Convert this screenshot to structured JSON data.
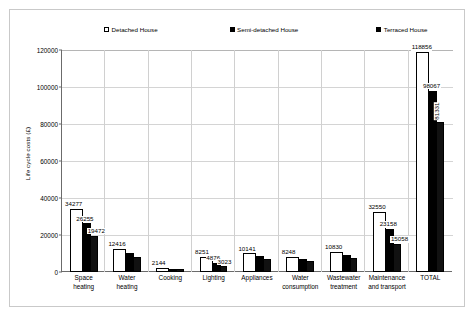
{
  "chart_data": {
    "type": "bar",
    "title": "",
    "subtitle": "",
    "xlabel": "",
    "ylabel": "Life cycle costs (£)",
    "ylim": [
      0,
      120000
    ],
    "yticks": [
      0,
      20000,
      40000,
      60000,
      80000,
      100000,
      120000
    ],
    "ytick_labels": [
      "0",
      "20000",
      "40000",
      "60000",
      "80000",
      "100000",
      "120000"
    ],
    "grid": true,
    "legend_position": "top",
    "categories": [
      "Space heating",
      "Water heating",
      "Cooking",
      "Lighting",
      "Appliances",
      "Water consumption",
      "Wastewater treatment",
      "Maintenance and transport",
      "TOTAL"
    ],
    "category_lines": [
      [
        "Space",
        "heating"
      ],
      [
        "Water",
        "heating"
      ],
      [
        "Cooking",
        ""
      ],
      [
        "Lighting",
        ""
      ],
      [
        "Appliances",
        ""
      ],
      [
        "Water",
        "consumption"
      ],
      [
        "Wastewater",
        "treatment"
      ],
      [
        "Maintenance",
        "and transport"
      ],
      [
        "TOTAL",
        ""
      ]
    ],
    "series": [
      {
        "name": "Detached House",
        "swatch": "white",
        "values": [
          34277,
          12416,
          2144,
          8251,
          10141,
          8248,
          10830,
          32550,
          118856
        ]
      },
      {
        "name": "Semi-detached House",
        "swatch": "black",
        "values": [
          26255,
          10200,
          1760,
          4876,
          8400,
          6900,
          9000,
          23158,
          98067
        ]
      },
      {
        "name": "Terraced House",
        "swatch": "hatch",
        "values": [
          19472,
          8300,
          1450,
          3023,
          7100,
          5800,
          7600,
          15058,
          81331
        ]
      }
    ],
    "visible_data_labels": {
      "Space heating": [
        "34277",
        "26255",
        "19472"
      ],
      "Water heating": [
        "12416"
      ],
      "Cooking": [
        "2144"
      ],
      "Lighting": [
        "8251",
        "4876",
        "3023"
      ],
      "Appliances": [
        "10141"
      ],
      "Water consumption": [
        "8248"
      ],
      "Wastewater treatment": [
        "10830"
      ],
      "Maintenance and transport": [
        "32550",
        "23158",
        "15058"
      ],
      "TOTAL": [
        "118856",
        "98067",
        "81331"
      ]
    },
    "colors": {
      "series_1": "#ffffff",
      "series_2": "#000000",
      "series_3": "#111111",
      "grid": "#d4d4d4",
      "axis": "#6b6b6b",
      "frame": "#c9c9c9"
    }
  }
}
